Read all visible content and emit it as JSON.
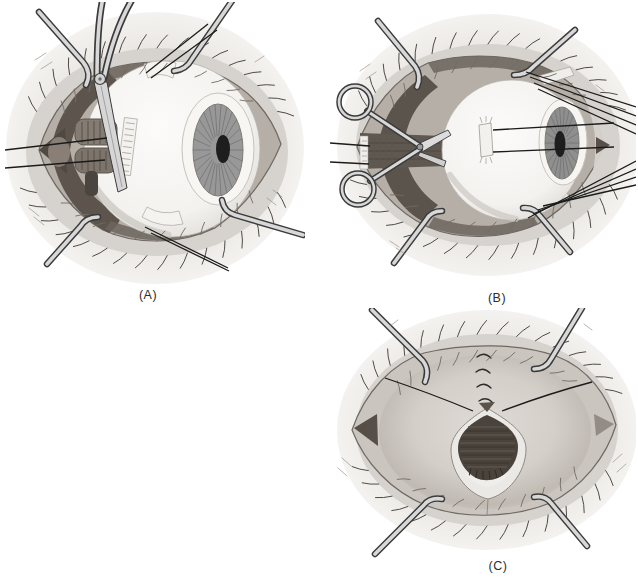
{
  "figure": {
    "name": "eye-surgery-three-panel-illustration",
    "background": "#ffffff",
    "panels": [
      {
        "id": "A",
        "label": "(A)",
        "name": "globe-exposed-clamp-on-muscle-stump"
      },
      {
        "id": "B",
        "label": "(B)",
        "name": "scissors-dividing-posterior-attachments"
      },
      {
        "id": "C",
        "label": "(C)",
        "name": "socket-with-suture-closure"
      }
    ],
    "palette": {
      "paper": "#ffffff",
      "skin": "#ebe8e4",
      "lid": "#d6d2cd",
      "base": "#b6afa8",
      "dark": "#5b544d",
      "iris": "#989898",
      "pupil": "#1e1e1e",
      "metal": "#d8d8d8",
      "metaldark": "#3b3b3b",
      "line": "#1b1b1b",
      "label": "#2d2d2d"
    }
  }
}
